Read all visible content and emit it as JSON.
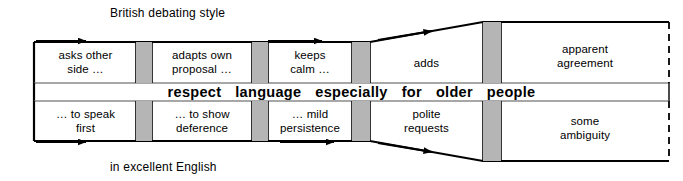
{
  "diagram": {
    "title": "British debating style",
    "footer": "in excellent English",
    "middle_band": {
      "words": [
        "respect",
        "language",
        "especially",
        "for",
        "older",
        "people"
      ],
      "text": "respect language especially for older people"
    },
    "top_row": {
      "name": "British debating style",
      "stages": [
        {
          "label": "asks other\nside …",
          "line1": "asks other",
          "line2": "side …"
        },
        {
          "label": "adapts own\nproposal …",
          "line1": "adapts own",
          "line2": "proposal …"
        },
        {
          "label": "keeps\ncalm …",
          "line1": "keeps",
          "line2": "calm …"
        },
        {
          "label": "adds",
          "line1": "adds",
          "line2": ""
        }
      ],
      "outcome": {
        "line1": "apparent",
        "line2": "agreement"
      }
    },
    "bottom_row": {
      "name": "in excellent English",
      "stages": [
        {
          "label": "… to speak\nfirst",
          "line1": "… to speak",
          "line2": "first"
        },
        {
          "label": "… to show\ndeference",
          "line1": "… to show",
          "line2": "deference"
        },
        {
          "label": "… mild\npersistence",
          "line1": "… mild",
          "line2": "persistence"
        },
        {
          "label": "polite\nrequests",
          "line1": "polite",
          "line2": "requests"
        }
      ],
      "outcome": {
        "line1": "some",
        "line2": "ambiguity"
      }
    },
    "colors": {
      "stroke": "#000000",
      "gate_fill": "#b5b5b5",
      "background": "#ffffff",
      "thin_rule": "#888888"
    }
  }
}
